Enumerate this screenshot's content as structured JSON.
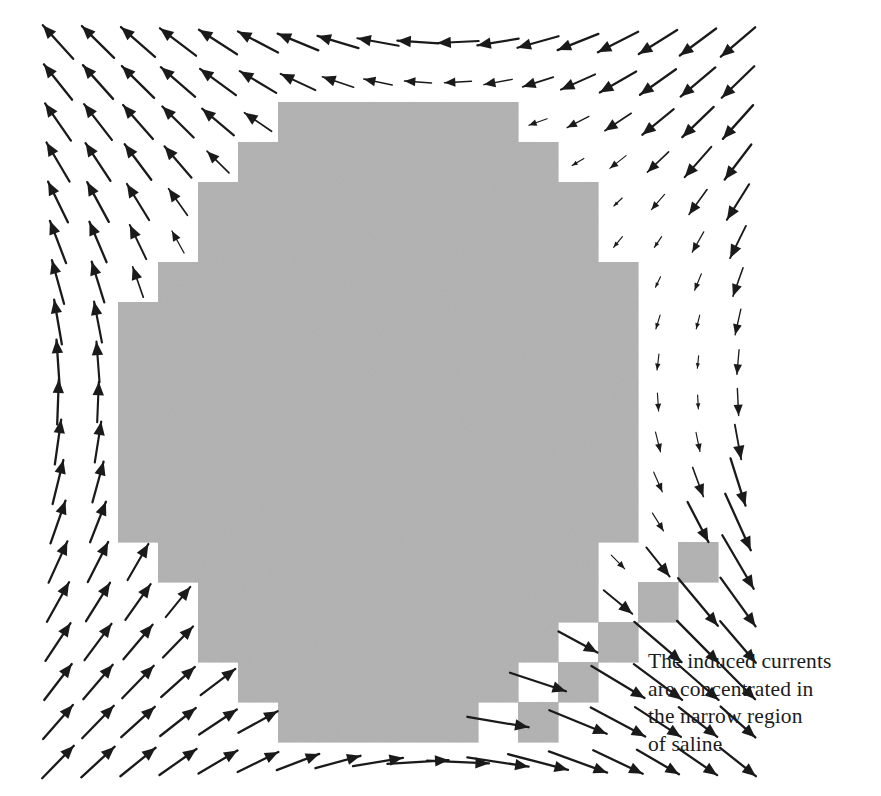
{
  "figure": {
    "width": 881,
    "height": 796,
    "background_color": "#ffffff",
    "type": "vector-field-overlay-on-pixelated-conductor"
  },
  "caption": {
    "text": "The induced currents\nare concentrated in\nthe narrow region\nof saline",
    "lines": [
      "The induced currents",
      "are concentrated in",
      "the narrow region",
      "of saline"
    ],
    "x": 648,
    "y": 648,
    "font_size": 21.5,
    "line_height": 27.5,
    "color": "#1c1c1c"
  },
  "conductor": {
    "name": "saline-region",
    "fill_color": "#b4b4b4",
    "cell_size": 40,
    "origin_x": 38,
    "origin_y": 22,
    "description": "pixelated disc of saline plus a detached diagonal staircase of isolated cells",
    "disc_rows": [
      {
        "row": 2,
        "col_start": 6,
        "col_end": 11
      },
      {
        "row": 3,
        "col_start": 5,
        "col_end": 12
      },
      {
        "row": 4,
        "col_start": 4,
        "col_end": 13
      },
      {
        "row": 5,
        "col_start": 4,
        "col_end": 13
      },
      {
        "row": 6,
        "col_start": 3,
        "col_end": 14
      },
      {
        "row": 7,
        "col_start": 2,
        "col_end": 14
      },
      {
        "row": 8,
        "col_start": 2,
        "col_end": 14
      },
      {
        "row": 9,
        "col_start": 2,
        "col_end": 14
      },
      {
        "row": 10,
        "col_start": 2,
        "col_end": 14
      },
      {
        "row": 11,
        "col_start": 2,
        "col_end": 14
      },
      {
        "row": 12,
        "col_start": 2,
        "col_end": 14
      },
      {
        "row": 13,
        "col_start": 3,
        "col_end": 13
      },
      {
        "row": 14,
        "col_start": 4,
        "col_end": 13
      },
      {
        "row": 15,
        "col_start": 4,
        "col_end": 12
      },
      {
        "row": 16,
        "col_start": 5,
        "col_end": 11
      },
      {
        "row": 17,
        "col_start": 6,
        "col_end": 10
      }
    ],
    "staircase_cells": [
      {
        "row": 13,
        "col": 16
      },
      {
        "row": 14,
        "col": 15
      },
      {
        "row": 15,
        "col": 14
      },
      {
        "row": 16,
        "col": 13
      },
      {
        "row": 17,
        "col": 12
      }
    ]
  },
  "chart_data": {
    "type": "scatter",
    "xlabel": "",
    "ylabel": "",
    "grid": false,
    "legend": null,
    "field_model": {
      "name": "induced-current-circulation",
      "center_x": 441,
      "center_y": 388,
      "rotation": "counter-clockwise",
      "base_length": 30,
      "suppression_inside_conductor": 0.0,
      "gap_amplification": 2.1,
      "gap_axis_angle_deg": 45,
      "description": "Arrows circulate about the disc centre; magnitude grows with radius, is zero inside the conducting disc, and is strongly amplified along the narrow diagonal saline channel at lower right."
    },
    "grid_spec": {
      "columns": 18,
      "rows": 19,
      "pitch": 40,
      "first_x": 58,
      "first_y": 42
    },
    "arrow_color": "#1a1a1a",
    "notes": [
      "Top-left arrows point up-right at about 45 degrees",
      "Top-right arrows point straight up and are short",
      "Bottom-left arrows point right and are horizontal",
      "Longest arrows lie in the narrow diagonal gap between disc and staircase"
    ]
  }
}
